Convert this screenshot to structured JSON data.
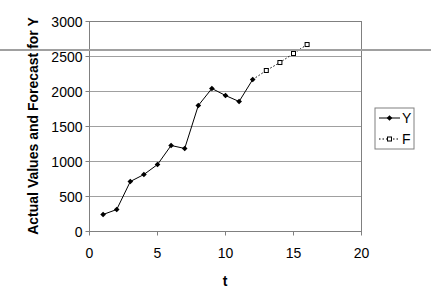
{
  "chart_data": {
    "type": "line",
    "title": "",
    "xlabel": "t",
    "ylabel": "Actual Values and Forecast for Y",
    "xlim": [
      0,
      20
    ],
    "ylim": [
      0,
      3000
    ],
    "xticks": [
      0,
      5,
      10,
      15,
      20
    ],
    "yticks": [
      0,
      500,
      1000,
      1500,
      2000,
      2500,
      3000
    ],
    "grid": "horizontal",
    "legend_position": "right",
    "series": [
      {
        "name": "Y",
        "style": "solid line, filled diamond markers",
        "x": [
          1,
          2,
          3,
          4,
          5,
          6,
          7,
          8,
          9,
          10,
          11,
          12
        ],
        "values": [
          243,
          314,
          714,
          814,
          957,
          1229,
          1186,
          1800,
          2043,
          1943,
          1857,
          2171
        ]
      },
      {
        "name": "F",
        "style": "dotted line, hollow square markers",
        "x": [
          12,
          13,
          14,
          15,
          16
        ],
        "values": [
          2171,
          2300,
          2414,
          2543,
          2671
        ]
      }
    ]
  },
  "legend": {
    "items": [
      {
        "label": "Y"
      },
      {
        "label": "F"
      }
    ]
  },
  "colors": {
    "series_line": "#000000",
    "grid": "#808080",
    "plot_border": "#808080"
  }
}
